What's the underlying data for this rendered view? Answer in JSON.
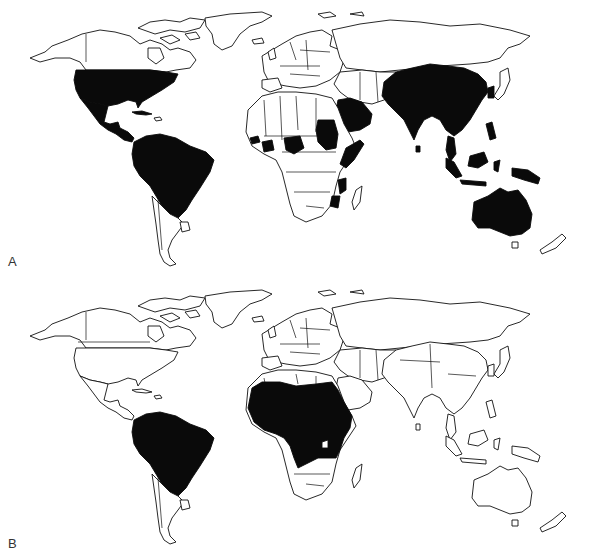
{
  "figure": {
    "type": "world_choropleth_maps",
    "fill_color": "#0a0a0a",
    "outline_color": "#111111",
    "background": "#ffffff"
  },
  "panels": [
    {
      "label": "A",
      "highlighted_regions": [
        "United States",
        "Mexico",
        "Central America",
        "Cuba",
        "Colombia",
        "Venezuela",
        "Guyana",
        "Suriname",
        "French Guiana",
        "Ecuador",
        "Peru",
        "Bolivia",
        "Brazil",
        "Paraguay",
        "Senegal",
        "Gambia",
        "Côte d'Ivoire",
        "Ghana",
        "Nigeria",
        "Sudan",
        "Saudi Arabia",
        "Yemen",
        "Oman",
        "Somalia",
        "Kenya",
        "Mozambique",
        "Pakistan",
        "India",
        "China",
        "Mongolia",
        "Korea",
        "Bangladesh",
        "Myanmar",
        "Thailand",
        "Vietnam",
        "Laos",
        "Cambodia",
        "Malaysia",
        "Indonesia",
        "Philippines",
        "Papua New Guinea",
        "Australia"
      ]
    },
    {
      "label": "B",
      "highlighted_regions": [
        "Colombia",
        "Venezuela",
        "Guyana",
        "Suriname",
        "French Guiana",
        "Ecuador",
        "Peru",
        "Bolivia",
        "Brazil",
        "Paraguay",
        "Mauritania",
        "Senegal",
        "Mali",
        "Niger",
        "Chad",
        "Sudan",
        "Guinea",
        "Sierra Leone",
        "Liberia",
        "Côte d'Ivoire",
        "Ghana",
        "Burkina Faso",
        "Nigeria",
        "Cameroon",
        "Central African Republic",
        "Ethiopia",
        "Somalia",
        "Kenya",
        "Uganda",
        "Tanzania",
        "DR Congo",
        "Congo",
        "Gabon",
        "Angola",
        "Zambia"
      ]
    }
  ]
}
